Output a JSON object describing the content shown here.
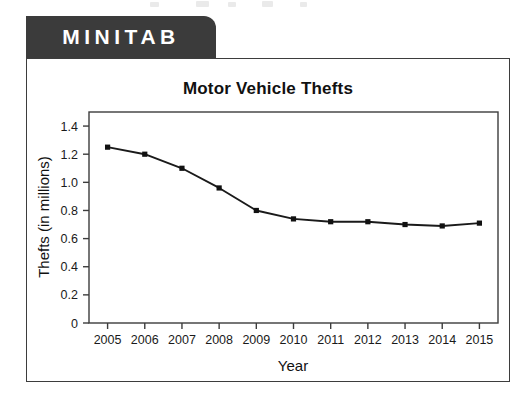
{
  "brand": {
    "tab_label": "MINITAB",
    "tab_bg": "#3b3b3b",
    "tab_text_color": "#ffffff"
  },
  "figure": {
    "border_color": "#3d3d3d",
    "background": "#ffffff"
  },
  "chart_data": {
    "type": "line",
    "title": "Motor Vehicle Thefts",
    "xlabel": "Year",
    "ylabel": "Thefts (in millions)",
    "categories": [
      "2005",
      "2006",
      "2007",
      "2008",
      "2009",
      "2010",
      "2011",
      "2012",
      "2013",
      "2014",
      "2015"
    ],
    "x": [
      2005,
      2006,
      2007,
      2008,
      2009,
      2010,
      2011,
      2012,
      2013,
      2014,
      2015
    ],
    "values": [
      1.25,
      1.2,
      1.1,
      0.96,
      0.8,
      0.74,
      0.72,
      0.72,
      0.7,
      0.69,
      0.71
    ],
    "series": [
      {
        "name": "Motor Vehicle Thefts",
        "values": [
          1.25,
          1.2,
          1.1,
          0.96,
          0.8,
          0.74,
          0.72,
          0.72,
          0.7,
          0.69,
          0.71
        ]
      }
    ],
    "ylim": [
      0,
      1.5
    ],
    "yticks": [
      0,
      0.2,
      0.4,
      0.6,
      0.8,
      1.0,
      1.2,
      1.4
    ],
    "ytick_labels": [
      "0",
      "0.2",
      "0.4",
      "0.6",
      "0.8",
      "1.0",
      "1.2",
      "1.4"
    ],
    "xlim": [
      2004.5,
      2015.5
    ],
    "grid": false,
    "legend": false,
    "line_color": "#1a1a1a",
    "marker": "square",
    "marker_color": "#111111"
  }
}
